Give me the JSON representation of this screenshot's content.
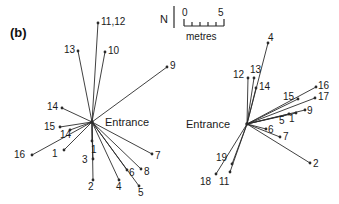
{
  "figure": {
    "panel_tag": "(b)",
    "width": 339,
    "height": 204,
    "background": "#ffffff",
    "line_color": "#2b2b2b",
    "text_color": "#1a1a1a"
  },
  "scale_bar": {
    "north_label": "N",
    "start_label": "0",
    "end_label": "5",
    "unit_label": "metres"
  },
  "panels": [
    {
      "id": "left-nest",
      "center_label": "Entrance",
      "center": {
        "x": 92,
        "y": 122
      },
      "rays": [
        {
          "label": "11,12",
          "end": {
            "x": 98,
            "y": 23
          },
          "label_pos": {
            "x": 101,
            "y": 17
          }
        },
        {
          "label": "13",
          "end": {
            "x": 78,
            "y": 51
          },
          "label_pos": {
            "x": 64,
            "y": 45
          }
        },
        {
          "label": "10",
          "end": {
            "x": 105,
            "y": 52
          },
          "label_pos": {
            "x": 108,
            "y": 46
          }
        },
        {
          "label": "9",
          "end": {
            "x": 167,
            "y": 67
          },
          "label_pos": {
            "x": 170,
            "y": 61
          }
        },
        {
          "label": "14",
          "end": {
            "x": 62,
            "y": 108
          },
          "label_pos": {
            "x": 47,
            "y": 102
          }
        },
        {
          "label": "15",
          "end": {
            "x": 60,
            "y": 127
          },
          "label_pos": {
            "x": 44,
            "y": 122
          }
        },
        {
          "label": "14",
          "end": {
            "x": 70,
            "y": 130
          },
          "label_pos": {
            "x": 60,
            "y": 130
          }
        },
        {
          "label": "16",
          "end": {
            "x": 32,
            "y": 155
          },
          "label_pos": {
            "x": 14,
            "y": 150
          }
        },
        {
          "label": "1",
          "end": {
            "x": 64,
            "y": 150
          },
          "label_pos": {
            "x": 52,
            "y": 149
          }
        },
        {
          "label": "1",
          "end": {
            "x": 92,
            "y": 141
          },
          "label_pos": {
            "x": 91,
            "y": 145
          }
        },
        {
          "label": "3",
          "end": {
            "x": 93,
            "y": 159
          },
          "label_pos": {
            "x": 82,
            "y": 155
          }
        },
        {
          "label": "2",
          "end": {
            "x": 93,
            "y": 180
          },
          "label_pos": {
            "x": 88,
            "y": 182
          }
        },
        {
          "label": "4",
          "end": {
            "x": 119,
            "y": 180
          },
          "label_pos": {
            "x": 116,
            "y": 182
          }
        },
        {
          "label": "5",
          "end": {
            "x": 139,
            "y": 186
          },
          "label_pos": {
            "x": 138,
            "y": 188
          }
        },
        {
          "label": "6",
          "end": {
            "x": 127,
            "y": 170
          },
          "label_pos": {
            "x": 129,
            "y": 168
          }
        },
        {
          "label": "8",
          "end": {
            "x": 141,
            "y": 169
          },
          "label_pos": {
            "x": 144,
            "y": 167
          }
        },
        {
          "label": "7",
          "end": {
            "x": 152,
            "y": 154
          },
          "label_pos": {
            "x": 155,
            "y": 151
          }
        }
      ]
    },
    {
      "id": "right-nest",
      "center_label": "Entrance",
      "center": {
        "x": 247,
        "y": 124
      },
      "rays": [
        {
          "label": "4",
          "end": {
            "x": 268,
            "y": 43
          },
          "label_pos": {
            "x": 268,
            "y": 33
          }
        },
        {
          "label": "13",
          "end": {
            "x": 254,
            "y": 78
          },
          "label_pos": {
            "x": 250,
            "y": 65
          }
        },
        {
          "label": "12",
          "end": {
            "x": 248,
            "y": 78
          },
          "label_pos": {
            "x": 233,
            "y": 70
          }
        },
        {
          "label": "14",
          "end": {
            "x": 256,
            "y": 88
          },
          "label_pos": {
            "x": 259,
            "y": 82
          }
        },
        {
          "label": "16",
          "end": {
            "x": 316,
            "y": 87
          },
          "label_pos": {
            "x": 318,
            "y": 81
          }
        },
        {
          "label": "17",
          "end": {
            "x": 315,
            "y": 98
          },
          "label_pos": {
            "x": 318,
            "y": 92
          }
        },
        {
          "label": "15",
          "end": {
            "x": 298,
            "y": 99
          },
          "label_pos": {
            "x": 283,
            "y": 92
          }
        },
        {
          "label": "9",
          "end": {
            "x": 305,
            "y": 110
          },
          "label_pos": {
            "x": 307,
            "y": 106
          }
        },
        {
          "label": "5",
          "end": {
            "x": 289,
            "y": 114
          },
          "label_pos": {
            "x": 279,
            "y": 116
          }
        },
        {
          "label": "1",
          "end": {
            "x": 296,
            "y": 113
          },
          "label_pos": {
            "x": 289,
            "y": 114
          }
        },
        {
          "label": "6",
          "end": {
            "x": 266,
            "y": 129
          },
          "label_pos": {
            "x": 268,
            "y": 125
          }
        },
        {
          "label": "7",
          "end": {
            "x": 280,
            "y": 137
          },
          "label_pos": {
            "x": 283,
            "y": 132
          }
        },
        {
          "label": "2",
          "end": {
            "x": 310,
            "y": 163
          },
          "label_pos": {
            "x": 313,
            "y": 159
          }
        },
        {
          "label": "19",
          "end": {
            "x": 232,
            "y": 164
          },
          "label_pos": {
            "x": 216,
            "y": 153
          }
        },
        {
          "label": "18",
          "end": {
            "x": 216,
            "y": 174
          },
          "label_pos": {
            "x": 200,
            "y": 177
          }
        },
        {
          "label": "11",
          "end": {
            "x": 230,
            "y": 172
          },
          "label_pos": {
            "x": 219,
            "y": 177
          }
        }
      ]
    }
  ]
}
